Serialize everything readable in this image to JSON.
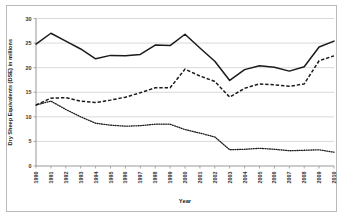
{
  "chart_data": {
    "type": "line",
    "title": "",
    "xlabel": "Year",
    "ylabel": "Dry Sheep Equivalents (DSE) in millions",
    "categories": [
      "1990",
      "1991",
      "1992",
      "1993",
      "1994",
      "1995",
      "1996",
      "1997",
      "1998",
      "1999",
      "2000",
      "2001",
      "2002",
      "2003",
      "2004",
      "2005",
      "2006",
      "2007",
      "2008",
      "2009",
      "2010"
    ],
    "x": [
      1990,
      1991,
      1992,
      1993,
      1994,
      1995,
      1996,
      1997,
      1998,
      1999,
      2000,
      2001,
      2002,
      2003,
      2004,
      2005,
      2006,
      2007,
      2008,
      2009,
      2010
    ],
    "ylim": [
      0,
      30
    ],
    "xlim": [
      1990,
      2010
    ],
    "yticks": [
      0,
      5,
      10,
      15,
      20,
      25,
      30
    ],
    "ytick_labels": [
      "0",
      "5",
      "10",
      "15",
      "20",
      "25",
      "30"
    ],
    "grid": "horizontal",
    "legend": "none",
    "series": [
      {
        "name": "Total",
        "style": "solid",
        "color": "#1a1a1a",
        "values": [
          24.8,
          27.0,
          25.4,
          23.8,
          21.8,
          22.5,
          22.4,
          22.7,
          24.6,
          24.5,
          26.8,
          24.0,
          21.3,
          17.4,
          19.6,
          20.4,
          20.1,
          19.3,
          20.2,
          24.2,
          25.4
        ]
      },
      {
        "name": "Series 2",
        "style": "dashed",
        "color": "#1a1a1a",
        "values": [
          12.4,
          13.8,
          13.9,
          13.2,
          12.9,
          13.4,
          14.0,
          14.9,
          15.9,
          15.9,
          19.7,
          18.3,
          17.2,
          14.0,
          15.8,
          16.7,
          16.5,
          16.2,
          16.7,
          21.4,
          22.4
        ]
      },
      {
        "name": "Series 3",
        "style": "dotted",
        "color": "#1a1a1a",
        "values": [
          12.4,
          13.2,
          11.5,
          10.0,
          8.7,
          8.3,
          8.1,
          8.2,
          8.5,
          8.5,
          7.4,
          6.7,
          5.9,
          3.3,
          3.4,
          3.6,
          3.4,
          3.1,
          3.2,
          3.3,
          2.8
        ]
      }
    ]
  }
}
